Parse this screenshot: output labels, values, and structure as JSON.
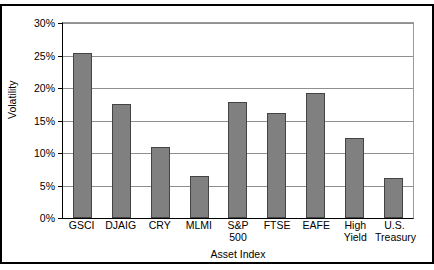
{
  "chart_data": {
    "type": "bar",
    "title": "",
    "xlabel": "Asset Index",
    "ylabel": "Volatility",
    "categories": [
      "GSCI",
      "DJAIG",
      "CRY",
      "MLMI",
      "S&P\n500",
      "FTSE",
      "EAFE",
      "High\nYield",
      "U.S.\nTreasury"
    ],
    "category_lines": [
      [
        "GSCI"
      ],
      [
        "DJAIG"
      ],
      [
        "CRY"
      ],
      [
        "MLMI"
      ],
      [
        "S&P",
        "500"
      ],
      [
        "FTSE"
      ],
      [
        "EAFE"
      ],
      [
        "High",
        "Yield"
      ],
      [
        "U.S.",
        "Treasury"
      ]
    ],
    "values": [
      25.4,
      17.6,
      10.9,
      6.4,
      17.8,
      16.2,
      19.3,
      12.3,
      6.2
    ],
    "ylim": [
      0,
      30
    ],
    "ytick_values": [
      0,
      5,
      10,
      15,
      20,
      25,
      30
    ],
    "ytick_labels": [
      "0%",
      "5%",
      "10%",
      "15%",
      "20%",
      "25%",
      "30%"
    ],
    "grid": true,
    "legend": null,
    "bar_color": "#808080",
    "bar_border_color": "#444444",
    "grid_color": "#8f8f8f",
    "axis_color": "#000000",
    "background": "#ffffff"
  }
}
